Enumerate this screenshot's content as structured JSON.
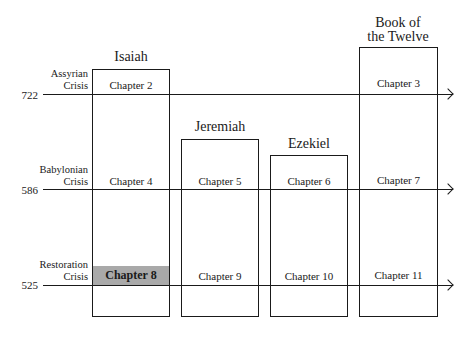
{
  "diagram": {
    "type": "timeline-matrix",
    "books": [
      {
        "name": "Isaiah",
        "title_lines": [
          "Isaiah"
        ]
      },
      {
        "name": "Jeremiah",
        "title_lines": [
          "Jeremiah"
        ]
      },
      {
        "name": "Ezekiel",
        "title_lines": [
          "Ezekiel"
        ]
      },
      {
        "name": "Book of the Twelve",
        "title_lines": [
          "Book of",
          "the Twelve"
        ]
      }
    ],
    "crises": [
      {
        "year": "722",
        "label_lines": [
          "Assyrian",
          "Crisis"
        ]
      },
      {
        "year": "586",
        "label_lines": [
          "Babylonian",
          "Crisis"
        ]
      },
      {
        "year": "525",
        "label_lines": [
          "Restoration",
          "Crisis"
        ]
      }
    ],
    "chapters": {
      "isaiah_722": "Chapter 2",
      "twelve_722": "Chapter 3",
      "isaiah_586": "Chapter 4",
      "jeremiah_586": "Chapter 5",
      "ezekiel_586": "Chapter 6",
      "twelve_586": "Chapter 7",
      "isaiah_525": "Chapter 8",
      "jeremiah_525": "Chapter 9",
      "ezekiel_525": "Chapter 10",
      "twelve_525": "Chapter 11"
    },
    "highlighted_chapter": "Chapter 8",
    "highlight_color": "#a9a9a9",
    "line_color": "#1a1a1a"
  }
}
